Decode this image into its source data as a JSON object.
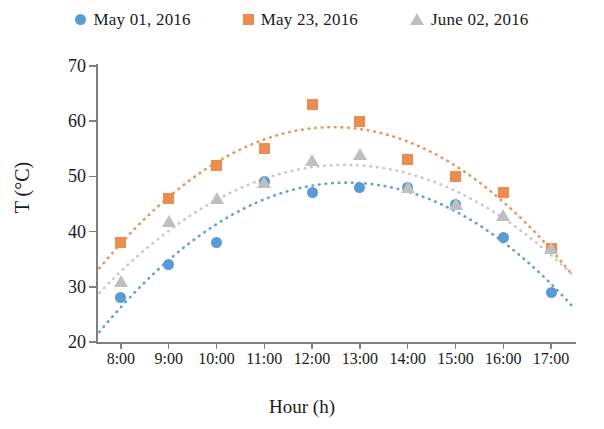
{
  "chart_data": {
    "type": "scatter",
    "title": "",
    "xlabel": "Hour (h)",
    "ylabel": "T (°C)",
    "categories": [
      "8:00",
      "9:00",
      "10:00",
      "11:00",
      "12:00",
      "13:00",
      "14:00",
      "15:00",
      "16:00",
      "17:00"
    ],
    "ylim": [
      20,
      70
    ],
    "yticks": [
      20,
      30,
      40,
      50,
      60,
      70
    ],
    "ytick_labels": [
      "20",
      "30",
      "40",
      "50",
      "60",
      "70"
    ],
    "grid": false,
    "legend_position": "top",
    "trendlines": true,
    "trendline_style": "dotted polynomial",
    "series": [
      {
        "name": "May 01, 2016",
        "marker": "circle",
        "color": "#5B9BD5",
        "values": [
          28,
          34,
          38,
          49,
          47,
          48,
          48,
          45,
          39,
          29
        ]
      },
      {
        "name": "May 23, 2016",
        "marker": "square",
        "color": "#ED8C4F",
        "values": [
          38,
          46,
          52,
          55,
          63,
          60,
          53,
          50,
          47,
          37
        ]
      },
      {
        "name": "June 02, 2016",
        "marker": "triangle",
        "color": "#BFBFBF",
        "values": [
          31,
          42,
          46,
          49,
          53,
          54,
          48,
          45,
          43,
          37
        ]
      }
    ]
  },
  "legend": {
    "items": [
      {
        "label": "May 01, 2016",
        "marker": "circle",
        "color": "#5B9BD5"
      },
      {
        "label": "May 23, 2016",
        "marker": "square",
        "color": "#ED8C4F"
      },
      {
        "label": "June 02, 2016",
        "marker": "triangle",
        "color": "#BFBFBF"
      }
    ]
  },
  "axes": {
    "y_title": "T (°C)",
    "x_title": "Hour (h)"
  }
}
